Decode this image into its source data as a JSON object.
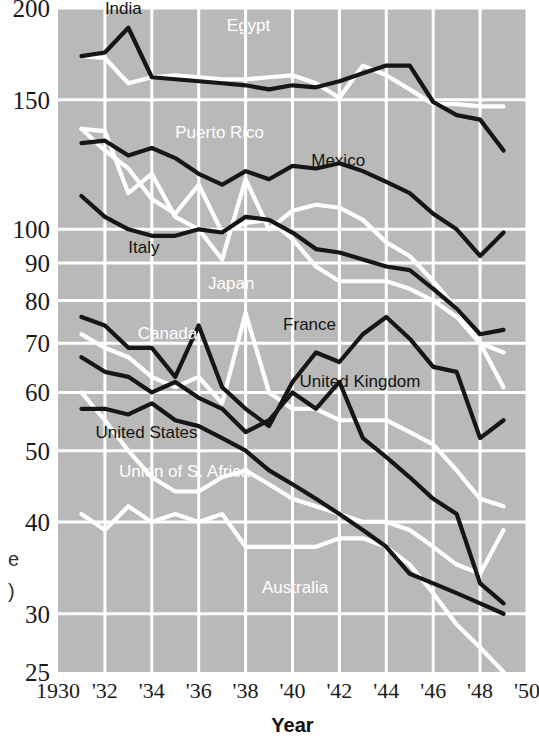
{
  "figure": {
    "background_color": "#ffffff",
    "plot_background_color": "#b9b9b9",
    "gridline_color": "#ffffff",
    "dark_series_color": "#161616",
    "light_series_color": "#ffffff",
    "xaxis_title": "Year",
    "clipped_left_fragment_1": "e",
    "clipped_left_fragment_2": ")"
  },
  "chart_data": {
    "type": "line",
    "title": "",
    "xlabel": "Year",
    "ylabel": "",
    "yscale": "log",
    "ylim": [
      25,
      200
    ],
    "xlim": [
      1930,
      1950
    ],
    "grid": true,
    "legend": "inline-labels",
    "ytick_labels": [
      "200",
      "150",
      "100",
      "90",
      "80",
      "70",
      "60",
      "50",
      "40",
      "30",
      "25"
    ],
    "ytick_values": [
      200,
      150,
      100,
      90,
      80,
      70,
      60,
      50,
      40,
      30,
      25
    ],
    "xtick_labels": [
      "1930",
      "'32",
      "'34",
      "'36",
      "'38",
      "'40",
      "'42",
      "'44",
      "'46",
      "'48",
      "'50"
    ],
    "xtick_values": [
      1930,
      1932,
      1934,
      1936,
      1938,
      1940,
      1942,
      1944,
      1946,
      1948,
      1950
    ],
    "x": [
      1931,
      1932,
      1933,
      1934,
      1935,
      1936,
      1937,
      1938,
      1939,
      1940,
      1941,
      1942,
      1943,
      1944,
      1945,
      1946,
      1947,
      1948,
      1949
    ],
    "series": [
      {
        "name": "India",
        "color": "dark",
        "label_x": 1932.0,
        "label_y": 196,
        "label_anchor": "start",
        "values": [
          172,
          174,
          188,
          161,
          160,
          159,
          158,
          157,
          155,
          157,
          156,
          159,
          163,
          167,
          167,
          149,
          143,
          141,
          128
        ]
      },
      {
        "name": "Egypt",
        "color": "light",
        "label_x": 1937.2,
        "label_y": 186,
        "label_anchor": "start",
        "values": [
          172,
          171,
          158,
          161,
          162,
          161,
          160,
          160,
          161,
          162,
          158,
          151,
          167,
          162,
          155,
          148,
          148,
          147,
          147
        ]
      },
      {
        "name": "Puerto Rico",
        "color": "light",
        "label_x": 1935.0,
        "label_y": 133,
        "label_anchor": "start",
        "values": [
          137,
          136,
          112,
          119,
          104,
          100,
          91,
          117,
          100,
          106,
          108,
          107,
          103,
          96,
          92,
          85,
          78,
          70,
          68
        ]
      },
      {
        "name": "Mexico",
        "color": "dark",
        "label_x": 1940.8,
        "label_y": 122,
        "label_anchor": "start",
        "values": [
          131,
          132,
          126,
          129,
          125,
          119,
          115,
          120,
          117,
          122,
          121,
          123,
          120,
          116,
          112,
          105,
          100,
          92,
          99
        ]
      },
      {
        "name": "Italy",
        "color": "dark",
        "label_x": 1933.0,
        "label_y": 93,
        "label_anchor": "start",
        "values": [
          111,
          104,
          100,
          98,
          98,
          100,
          99,
          104,
          103,
          99,
          94,
          93,
          91,
          89,
          88,
          83,
          78,
          72,
          73
        ]
      },
      {
        "name": "Japan",
        "color": "light",
        "label_x": 1936.4,
        "label_y": 83,
        "label_anchor": "start",
        "values": [
          137,
          128,
          121,
          110,
          105,
          115,
          99,
          102,
          103,
          97,
          89,
          85,
          85,
          85,
          83,
          80,
          76,
          70,
          61
        ]
      },
      {
        "name": "France",
        "color": "dark",
        "label_x": 1939.6,
        "label_y": 73,
        "label_anchor": "start",
        "values": [
          76,
          74,
          69,
          69,
          63,
          74,
          61,
          57,
          54,
          62,
          68,
          66,
          72,
          76,
          71,
          65,
          64,
          52,
          55
        ]
      },
      {
        "name": "Canada",
        "color": "light",
        "label_x": 1933.4,
        "label_y": 71,
        "label_anchor": "start",
        "values": [
          72,
          69,
          67,
          63,
          61,
          63,
          58,
          77,
          60,
          57,
          57,
          55,
          55,
          55,
          53,
          51,
          47,
          43,
          42
        ]
      },
      {
        "name": "United Kingdom",
        "color": "dark",
        "label_x": 1940.3,
        "label_y": 61,
        "label_anchor": "start",
        "values": [
          67,
          64,
          63,
          60,
          62,
          59,
          57,
          53,
          55,
          60,
          57,
          62,
          52,
          49,
          46,
          43,
          41,
          33,
          31
        ]
      },
      {
        "name": "United States",
        "color": "dark",
        "label_x": 1931.6,
        "label_y": 52,
        "label_anchor": "start",
        "values": [
          57,
          57,
          56,
          58,
          55,
          54,
          52,
          50,
          47,
          45,
          43,
          41,
          39,
          37,
          34,
          33,
          32,
          31,
          30
        ]
      },
      {
        "name": "Union of S. Africa",
        "color": "light",
        "label_x": 1932.6,
        "label_y": 46,
        "label_anchor": "start",
        "values": [
          60,
          55,
          50,
          46,
          44,
          44,
          46,
          47,
          45,
          43,
          42,
          41,
          40,
          40,
          39,
          37,
          35,
          34,
          39
        ]
      },
      {
        "name": "Australia",
        "color": "light",
        "label_x": 1938.7,
        "label_y": 32,
        "label_anchor": "start",
        "values": [
          41,
          39,
          42,
          40,
          41,
          40,
          41,
          37,
          37,
          37,
          37,
          38,
          38,
          37,
          35,
          32,
          29,
          27,
          25
        ]
      }
    ]
  }
}
